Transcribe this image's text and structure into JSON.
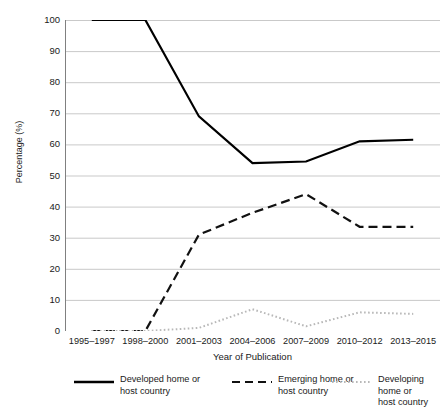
{
  "chart_data": {
    "type": "line",
    "title": "",
    "xlabel": "Year of Publication",
    "ylabel": "Percentage (%)",
    "categories": [
      "1995–1997",
      "1998–2000",
      "2001–2003",
      "2004–2006",
      "2007–2009",
      "2010–2012",
      "2013–2015"
    ],
    "ylim": [
      0,
      100
    ],
    "ytick_values": [
      0,
      10,
      20,
      30,
      40,
      50,
      60,
      70,
      80,
      90,
      100
    ],
    "ytick_labels": [
      "0",
      "10",
      "20",
      "30",
      "40",
      "50",
      "60",
      "70",
      "80",
      "90",
      "100"
    ],
    "grid": "horizontal",
    "legend_position": "bottom",
    "series": [
      {
        "name": "Developed home or host country",
        "legend_label": "Developed home or\nhost country",
        "style": "solid",
        "color": "#000000",
        "width": 2.2,
        "values": [
          100,
          100,
          69,
          54,
          54.5,
          61,
          61.5
        ]
      },
      {
        "name": "Emerging home or host country",
        "legend_label": "Emerging home or\nhost country",
        "style": "dashed",
        "color": "#111111",
        "width": 2.2,
        "values": [
          0,
          0,
          31,
          38,
          44,
          33.5,
          33.5
        ]
      },
      {
        "name": "Developing home or host country",
        "legend_label": "Developing home or\nhost country",
        "style": "dotted",
        "color": "#b8b8b8",
        "width": 2.0,
        "values": [
          0,
          0,
          1,
          7,
          1.5,
          6,
          5.5
        ]
      }
    ]
  },
  "axes": {
    "y_axis_title": "Percentage (%)",
    "x_axis_title": "Year of Publication",
    "gridline_color": "#c9c9c9",
    "axis_color": "#808080"
  },
  "legend": {
    "entries": [
      {
        "label_line1": "Developed home or",
        "label_line2": "host country",
        "icon": "solid-line-icon"
      },
      {
        "label_line1": "Emerging home or",
        "label_line2": "host country",
        "icon": "dashed-line-icon"
      },
      {
        "label_line1": "Developing home or",
        "label_line2": "host country",
        "icon": "dotted-line-icon"
      }
    ]
  }
}
